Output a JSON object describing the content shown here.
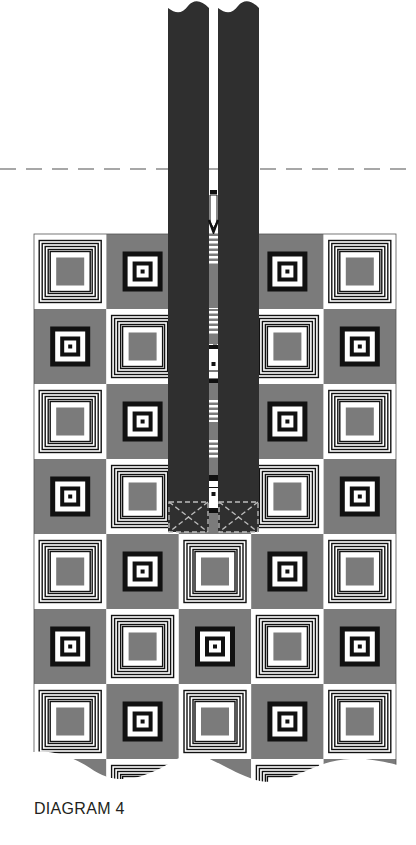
{
  "caption": "DIAGRAM 4",
  "colors": {
    "gray": "#7b7b7b",
    "tape": "#2f2f2f",
    "black": "#111111",
    "white": "#ffffff",
    "dash": "#8a8a8a"
  },
  "grid": {
    "cols": 5,
    "rows": 8,
    "left": 34,
    "top": 234,
    "cell_w": 72.4,
    "cell_h": 75,
    "pattern": "checkerboard",
    "even_block": "concentric-lines",
    "odd_block": "target"
  },
  "zipper": {
    "left_tape": {
      "x": 168,
      "w": 41
    },
    "right_tape": {
      "x": 218,
      "w": 41
    },
    "top": 0,
    "bottom": 532,
    "stop_box_top": 502
  },
  "fold_line": {
    "y": 169
  }
}
